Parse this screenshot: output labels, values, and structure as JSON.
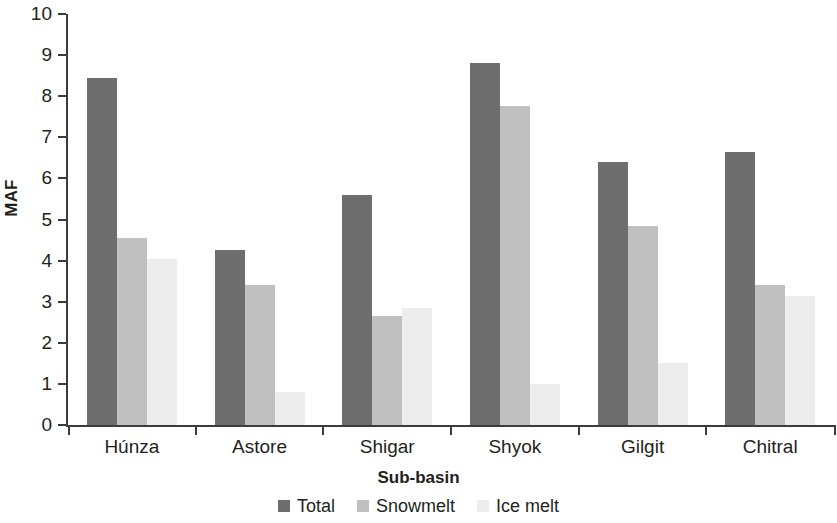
{
  "chart_data": {
    "type": "bar",
    "title": "",
    "xlabel": "Sub-basin",
    "ylabel": "MAF",
    "ylim": [
      0,
      10
    ],
    "yticks": [
      0,
      1,
      2,
      3,
      4,
      5,
      6,
      7,
      8,
      9,
      10
    ],
    "ytick_labels": [
      "0",
      "1",
      "2",
      "3",
      "4",
      "5",
      "6",
      "7",
      "8",
      "9",
      "10"
    ],
    "grid": false,
    "legend_position": "bottom",
    "categories": [
      "Húnza",
      "Astore",
      "Shigar",
      "Shyok",
      "Gilgit",
      "Chitral"
    ],
    "series": [
      {
        "name": "Total",
        "color": "#6e6e6e",
        "values": [
          8.45,
          4.25,
          5.6,
          8.8,
          6.4,
          6.65
        ]
      },
      {
        "name": "Snowmelt",
        "color": "#c0c0c0",
        "values": [
          4.55,
          3.4,
          2.65,
          7.75,
          4.85,
          3.4
        ]
      },
      {
        "name": "Ice melt",
        "color": "#ededed",
        "values": [
          4.05,
          0.8,
          2.85,
          1.0,
          1.5,
          3.15
        ]
      }
    ]
  },
  "axes": {
    "y_title": "MAF",
    "x_title": "Sub-basin"
  }
}
